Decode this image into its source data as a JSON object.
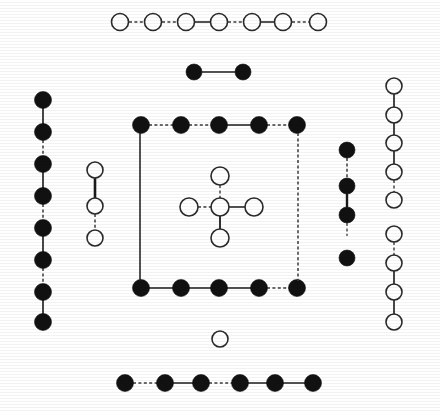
{
  "figure": {
    "width": 440,
    "height": 411,
    "background_color": "#ffffff",
    "atom_types": [
      {
        "key": "filled",
        "label": "filled circle atom",
        "fill": "#111111",
        "stroke": "#111111"
      },
      {
        "key": "open",
        "label": "open circle atom",
        "fill": "#ffffff",
        "stroke": "#2a2a2a"
      }
    ],
    "groups": [
      {
        "name": "top-open-chain",
        "atom_type": "open",
        "radius": 8.5,
        "atoms": [
          {
            "cx": 120,
            "cy": 22
          },
          {
            "cx": 153,
            "cy": 22
          },
          {
            "cx": 186,
            "cy": 22
          },
          {
            "cx": 219,
            "cy": 22
          },
          {
            "cx": 252,
            "cy": 22
          },
          {
            "cx": 283,
            "cy": 22
          },
          {
            "cx": 318,
            "cy": 22
          }
        ],
        "bonds": [
          {
            "x1": 129,
            "y1": 22,
            "x2": 144,
            "y2": 22,
            "style": "dashed",
            "width": 1.4
          },
          {
            "x1": 162,
            "y1": 22,
            "x2": 177,
            "y2": 22,
            "style": "dashed",
            "width": 1.4
          },
          {
            "x1": 195,
            "y1": 22,
            "x2": 210,
            "y2": 22,
            "style": "solid",
            "width": 1.5
          },
          {
            "x1": 228,
            "y1": 22,
            "x2": 243,
            "y2": 22,
            "style": "dashed",
            "width": 1.4
          },
          {
            "x1": 261,
            "y1": 22,
            "x2": 274,
            "y2": 22,
            "style": "solid",
            "width": 1.5
          },
          {
            "x1": 292,
            "y1": 22,
            "x2": 309,
            "y2": 22,
            "style": "dashed",
            "width": 1.4
          }
        ]
      },
      {
        "name": "upper-filled-pair",
        "atom_type": "filled",
        "radius": 8,
        "atoms": [
          {
            "cx": 194,
            "cy": 72
          },
          {
            "cx": 243,
            "cy": 72
          }
        ],
        "bonds": [
          {
            "x1": 202,
            "y1": 72,
            "x2": 235,
            "y2": 72,
            "style": "solid",
            "width": 1.6
          }
        ]
      },
      {
        "name": "left-filled-column",
        "atom_type": "filled",
        "radius": 8.5,
        "atoms": [
          {
            "cx": 43,
            "cy": 100
          },
          {
            "cx": 43,
            "cy": 132
          },
          {
            "cx": 43,
            "cy": 164
          },
          {
            "cx": 43,
            "cy": 196
          },
          {
            "cx": 43,
            "cy": 228
          },
          {
            "cx": 43,
            "cy": 260
          },
          {
            "cx": 43,
            "cy": 292
          },
          {
            "cx": 43,
            "cy": 322
          }
        ],
        "bonds": [
          {
            "x1": 43,
            "y1": 108,
            "x2": 43,
            "y2": 124,
            "style": "solid",
            "width": 1.6
          },
          {
            "x1": 43,
            "y1": 140,
            "x2": 43,
            "y2": 156,
            "style": "dashed",
            "width": 1.5
          },
          {
            "x1": 43,
            "y1": 172,
            "x2": 43,
            "y2": 188,
            "style": "solid",
            "width": 1.6
          },
          {
            "x1": 43,
            "y1": 204,
            "x2": 43,
            "y2": 220,
            "style": "dashed",
            "width": 1.5
          },
          {
            "x1": 43,
            "y1": 236,
            "x2": 43,
            "y2": 252,
            "style": "solid",
            "width": 1.6
          },
          {
            "x1": 43,
            "y1": 268,
            "x2": 43,
            "y2": 284,
            "style": "dashed",
            "width": 1.5
          },
          {
            "x1": 43,
            "y1": 300,
            "x2": 43,
            "y2": 314,
            "style": "solid",
            "width": 1.6
          }
        ]
      },
      {
        "name": "left-inner-open-chain",
        "atom_type": "open",
        "radius": 8,
        "atoms": [
          {
            "cx": 95,
            "cy": 170
          },
          {
            "cx": 95,
            "cy": 206
          },
          {
            "cx": 95,
            "cy": 238
          }
        ],
        "bonds": [
          {
            "x1": 95,
            "y1": 178,
            "x2": 95,
            "y2": 198,
            "style": "solid",
            "width": 2.6
          },
          {
            "x1": 95,
            "y1": 214,
            "x2": 95,
            "y2": 230,
            "style": "dashed",
            "width": 1.5
          }
        ]
      },
      {
        "name": "unit-cell-top-row",
        "atom_type": "filled",
        "radius": 8.5,
        "atoms": [
          {
            "cx": 141,
            "cy": 125
          },
          {
            "cx": 181,
            "cy": 125
          },
          {
            "cx": 219,
            "cy": 125
          },
          {
            "cx": 259,
            "cy": 125
          },
          {
            "cx": 297,
            "cy": 125
          }
        ],
        "bonds": [
          {
            "x1": 149,
            "y1": 125,
            "x2": 173,
            "y2": 125,
            "style": "dashed",
            "width": 1.4
          },
          {
            "x1": 189,
            "y1": 125,
            "x2": 211,
            "y2": 125,
            "style": "dashed",
            "width": 1.4
          },
          {
            "x1": 227,
            "y1": 125,
            "x2": 251,
            "y2": 125,
            "style": "solid",
            "width": 1.5
          },
          {
            "x1": 267,
            "y1": 125,
            "x2": 289,
            "y2": 125,
            "style": "dashed",
            "width": 1.4
          }
        ]
      },
      {
        "name": "unit-cell-bottom-row",
        "atom_type": "filled",
        "radius": 8.5,
        "atoms": [
          {
            "cx": 141,
            "cy": 288
          },
          {
            "cx": 181,
            "cy": 288
          },
          {
            "cx": 219,
            "cy": 288
          },
          {
            "cx": 259,
            "cy": 288
          },
          {
            "cx": 297,
            "cy": 288
          }
        ],
        "bonds": [
          {
            "x1": 149,
            "y1": 288,
            "x2": 173,
            "y2": 288,
            "style": "solid",
            "width": 1.5
          },
          {
            "x1": 189,
            "y1": 288,
            "x2": 211,
            "y2": 288,
            "style": "solid",
            "width": 1.5
          },
          {
            "x1": 227,
            "y1": 288,
            "x2": 251,
            "y2": 288,
            "style": "solid",
            "width": 1.5
          },
          {
            "x1": 267,
            "y1": 288,
            "x2": 289,
            "y2": 288,
            "style": "dashed",
            "width": 1.4
          }
        ]
      },
      {
        "name": "unit-cell-edges",
        "atom_type": "none",
        "radius": 0,
        "atoms": [],
        "bonds": [
          {
            "x1": 140,
            "y1": 133,
            "x2": 140,
            "y2": 281,
            "style": "solid",
            "width": 1.5
          },
          {
            "x1": 298,
            "y1": 133,
            "x2": 298,
            "y2": 281,
            "style": "dashed",
            "width": 1.5
          }
        ]
      },
      {
        "name": "central-cross-group",
        "atom_type": "open",
        "radius": 9,
        "atoms": [
          {
            "cx": 220,
            "cy": 176
          },
          {
            "cx": 189,
            "cy": 207
          },
          {
            "cx": 220,
            "cy": 207
          },
          {
            "cx": 254,
            "cy": 207
          },
          {
            "cx": 220,
            "cy": 238
          }
        ],
        "bonds": [
          {
            "x1": 220,
            "y1": 185,
            "x2": 220,
            "y2": 198,
            "style": "dashed",
            "width": 1.4
          },
          {
            "x1": 198,
            "y1": 207,
            "x2": 211,
            "y2": 207,
            "style": "dashed",
            "width": 1.4
          },
          {
            "x1": 229,
            "y1": 207,
            "x2": 245,
            "y2": 207,
            "style": "solid",
            "width": 1.5
          },
          {
            "x1": 220,
            "y1": 216,
            "x2": 220,
            "y2": 229,
            "style": "solid",
            "width": 1.8
          }
        ]
      },
      {
        "name": "right-inner-filled-chain",
        "atom_type": "filled",
        "radius": 8,
        "atoms": [
          {
            "cx": 347,
            "cy": 150
          },
          {
            "cx": 347,
            "cy": 186
          },
          {
            "cx": 347,
            "cy": 215
          },
          {
            "cx": 347,
            "cy": 258
          }
        ],
        "bonds": [
          {
            "x1": 347,
            "y1": 158,
            "x2": 347,
            "y2": 178,
            "style": "dashed",
            "width": 1.5
          },
          {
            "x1": 347,
            "y1": 194,
            "x2": 347,
            "y2": 207,
            "style": "solid",
            "width": 2.4
          },
          {
            "x1": 347,
            "y1": 223,
            "x2": 347,
            "y2": 236,
            "style": "dashed",
            "width": 1.3
          }
        ]
      },
      {
        "name": "right-open-column",
        "atom_type": "open",
        "radius": 8,
        "atoms": [
          {
            "cx": 394,
            "cy": 86
          },
          {
            "cx": 394,
            "cy": 115
          },
          {
            "cx": 394,
            "cy": 143
          },
          {
            "cx": 394,
            "cy": 172
          },
          {
            "cx": 394,
            "cy": 200
          },
          {
            "cx": 394,
            "cy": 234
          },
          {
            "cx": 394,
            "cy": 263
          },
          {
            "cx": 394,
            "cy": 292
          },
          {
            "cx": 394,
            "cy": 322
          }
        ],
        "bonds": [
          {
            "x1": 394,
            "y1": 94,
            "x2": 394,
            "y2": 107,
            "style": "solid",
            "width": 1.6
          },
          {
            "x1": 394,
            "y1": 123,
            "x2": 394,
            "y2": 135,
            "style": "solid",
            "width": 1.6
          },
          {
            "x1": 394,
            "y1": 151,
            "x2": 394,
            "y2": 164,
            "style": "solid",
            "width": 1.6
          },
          {
            "x1": 394,
            "y1": 180,
            "x2": 394,
            "y2": 192,
            "style": "dashed",
            "width": 1.4
          },
          {
            "x1": 394,
            "y1": 242,
            "x2": 394,
            "y2": 255,
            "style": "dashed",
            "width": 1.4
          },
          {
            "x1": 394,
            "y1": 271,
            "x2": 394,
            "y2": 284,
            "style": "solid",
            "width": 1.6
          },
          {
            "x1": 394,
            "y1": 300,
            "x2": 394,
            "y2": 314,
            "style": "solid",
            "width": 1.6
          }
        ]
      },
      {
        "name": "lower-isolated-open-atom",
        "atom_type": "open",
        "radius": 8,
        "atoms": [
          {
            "cx": 220,
            "cy": 339
          }
        ],
        "bonds": []
      },
      {
        "name": "bottom-filled-chain",
        "atom_type": "filled",
        "radius": 8.5,
        "atoms": [
          {
            "cx": 125,
            "cy": 383
          },
          {
            "cx": 165,
            "cy": 383
          },
          {
            "cx": 201,
            "cy": 383
          },
          {
            "cx": 240,
            "cy": 383
          },
          {
            "cx": 275,
            "cy": 383
          },
          {
            "cx": 313,
            "cy": 383
          }
        ],
        "bonds": [
          {
            "x1": 133,
            "y1": 383,
            "x2": 157,
            "y2": 383,
            "style": "dashed",
            "width": 1.4
          },
          {
            "x1": 173,
            "y1": 383,
            "x2": 193,
            "y2": 383,
            "style": "solid",
            "width": 1.5
          },
          {
            "x1": 209,
            "y1": 383,
            "x2": 232,
            "y2": 383,
            "style": "dashed",
            "width": 1.4
          },
          {
            "x1": 248,
            "y1": 383,
            "x2": 267,
            "y2": 383,
            "style": "solid",
            "width": 1.5
          },
          {
            "x1": 283,
            "y1": 383,
            "x2": 305,
            "y2": 383,
            "style": "solid",
            "width": 1.5
          }
        ]
      }
    ]
  }
}
